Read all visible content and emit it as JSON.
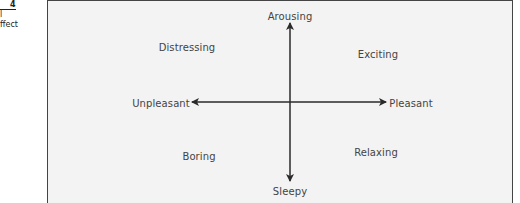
{
  "caption": {
    "figure_number": "4",
    "line2": "l",
    "line3": "ffect"
  },
  "diagram": {
    "vertical_axis": {
      "top_label": "Arousing",
      "bottom_label": "Sleepy"
    },
    "horizontal_axis": {
      "left_label": "Unpleasant",
      "right_label": "Pleasant"
    },
    "quadrants": {
      "top_left": "Distressing",
      "top_right": "Exciting",
      "bottom_left": "Boring",
      "bottom_right": "Relaxing"
    },
    "colors": {
      "background": "#f3f3f3",
      "axis": "#2a2a2a",
      "text": "#444444"
    }
  }
}
